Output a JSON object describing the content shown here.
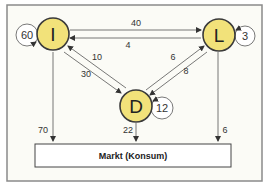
{
  "colors": {
    "node_fill": "#f2e27a",
    "node_stroke": "#3a3a3a",
    "frame_stroke": "#8a8a8a",
    "background": "#fbfbf6",
    "arrow": "#555555"
  },
  "nodes": {
    "I": {
      "label": "I",
      "self_loop": "60"
    },
    "L": {
      "label": "L",
      "self_loop": "3"
    },
    "D": {
      "label": "D",
      "self_loop": "12"
    }
  },
  "flows": {
    "L_to_I": "40",
    "I_to_L": "4",
    "D_to_I": "10",
    "I_to_D": "30",
    "D_to_L": "6",
    "L_to_D": "8",
    "I_to_market": "70",
    "D_to_market": "22",
    "L_to_market": "6"
  },
  "market": {
    "label": "Markt (Konsum)"
  }
}
